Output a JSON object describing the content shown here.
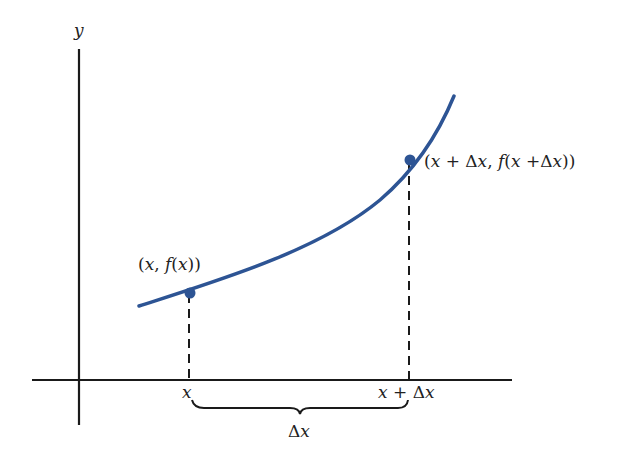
{
  "diagram": {
    "colors": {
      "curve": "#2d5494",
      "axes": "#1a1a1a",
      "background": "#ffffff"
    },
    "axes": {
      "y_label": "y"
    },
    "points": [
      {
        "label": "(x, f(x))",
        "parts": [
          "(",
          "x",
          ", ",
          "f",
          "(",
          "x",
          "))"
        ]
      },
      {
        "label": "(x + Δx, f(x +Δx))",
        "parts": [
          "(",
          "x",
          " + Δ",
          "x",
          ", ",
          "f",
          "(",
          "x",
          " +Δ",
          "x",
          "))"
        ]
      }
    ],
    "x_ticks": [
      {
        "label": "x"
      },
      {
        "label": "x + Δx",
        "parts": [
          "x",
          " + Δ",
          "x"
        ]
      }
    ],
    "brace_label": {
      "label": "Δx",
      "parts": [
        "Δ",
        "x"
      ]
    }
  }
}
